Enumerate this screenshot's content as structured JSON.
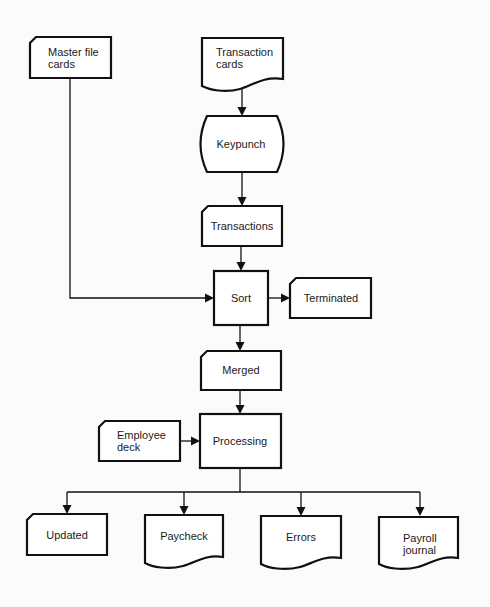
{
  "diagram": {
    "type": "flowchart",
    "nodes": {
      "master_file_cards": {
        "label_line1": "Master file",
        "label_line2": "cards",
        "shape": "card"
      },
      "transaction_cards": {
        "label_line1": "Transaction",
        "label_line2": "cards",
        "shape": "document"
      },
      "keypunch": {
        "label": "Keypunch",
        "shape": "manual-operation"
      },
      "transactions": {
        "label": "Transactions",
        "shape": "card"
      },
      "sort": {
        "label": "Sort",
        "shape": "process"
      },
      "terminated": {
        "label": "Terminated",
        "shape": "card"
      },
      "merged": {
        "label": "Merged",
        "shape": "card"
      },
      "employee_deck": {
        "label_line1": "Employee",
        "label_line2": "deck",
        "shape": "card"
      },
      "processing": {
        "label": "Processing",
        "shape": "process"
      },
      "updated": {
        "label": "Updated",
        "shape": "card"
      },
      "paycheck": {
        "label": "Paycheck",
        "shape": "document"
      },
      "errors": {
        "label": "Errors",
        "shape": "document"
      },
      "payroll_journal": {
        "label_line1": "Payroll",
        "label_line2": "journal",
        "shape": "document"
      }
    },
    "edges": [
      {
        "from": "Transaction cards",
        "to": "Keypunch"
      },
      {
        "from": "Keypunch",
        "to": "Transactions"
      },
      {
        "from": "Transactions",
        "to": "Sort"
      },
      {
        "from": "Master file cards",
        "to": "Sort"
      },
      {
        "from": "Sort",
        "to": "Terminated"
      },
      {
        "from": "Sort",
        "to": "Merged"
      },
      {
        "from": "Merged",
        "to": "Processing"
      },
      {
        "from": "Employee deck",
        "to": "Processing"
      },
      {
        "from": "Processing",
        "to": "Updated"
      },
      {
        "from": "Processing",
        "to": "Paycheck"
      },
      {
        "from": "Processing",
        "to": "Errors"
      },
      {
        "from": "Processing",
        "to": "Payroll journal"
      }
    ]
  }
}
